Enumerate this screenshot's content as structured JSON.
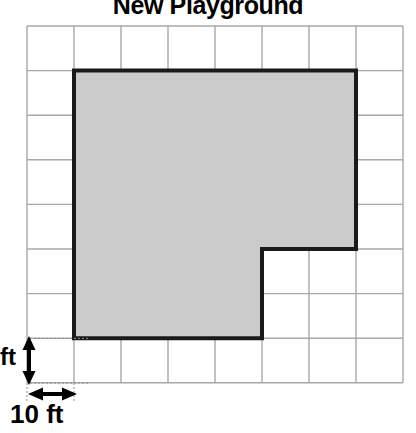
{
  "title": "New Playground",
  "colors": {
    "shape_fill": "#cbcbcb",
    "shape_stroke": "#1a1a1a",
    "grid_line": "#a8a8a8",
    "grid_border": "#a8a8a8",
    "background": "#ffffff",
    "text": "#000000",
    "arrow": "#000000",
    "guide_line": "#808080"
  },
  "grid": {
    "columns": 8,
    "rows": 8,
    "origin_x": 27,
    "origin_y": 26,
    "cell_width": 47,
    "cell_height": 44.6
  },
  "shape": {
    "name": "playground-polygon",
    "vertices_grid": [
      [
        1,
        1
      ],
      [
        7,
        1
      ],
      [
        7,
        5
      ],
      [
        5,
        5
      ],
      [
        5,
        7
      ],
      [
        1,
        7
      ]
    ],
    "stroke_width": 4
  },
  "scale": {
    "vertical_label": "ft",
    "horizontal_label": "10 ft",
    "unit": "ft",
    "cell_value": 10
  },
  "chart_data": {
    "type": "table",
    "title": "New Playground",
    "xlabel": "",
    "ylabel": "",
    "categories": [
      "grid_columns",
      "grid_rows",
      "cell_size_ft"
    ],
    "values": [
      8,
      8,
      10
    ],
    "grid": true,
    "legend": "none",
    "annotations": [
      "10 ft",
      "ft"
    ],
    "polygon_vertices_ft": [
      [
        10,
        10
      ],
      [
        70,
        10
      ],
      [
        70,
        50
      ],
      [
        50,
        50
      ],
      [
        50,
        70
      ],
      [
        10,
        70
      ]
    ],
    "area_cells": 32,
    "area_sq_ft": 3200,
    "perimeter_ft": 240
  }
}
